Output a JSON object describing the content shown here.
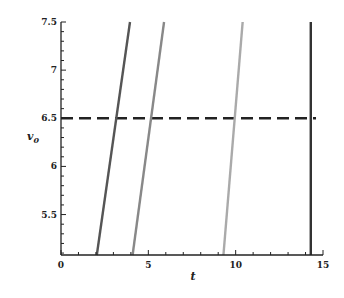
{
  "chart_data": {
    "type": "line",
    "title": "",
    "xlabel": "t",
    "ylabel": "v_0",
    "ylabel_display": "v",
    "ylabel_sub": "0",
    "xlim": [
      0,
      15
    ],
    "ylim": [
      5.08,
      7.5
    ],
    "x_ticks": [
      0,
      5,
      10,
      15
    ],
    "x_tick_labels": [
      "0",
      "5",
      "10",
      "15"
    ],
    "y_ticks": [
      5.5,
      6,
      6.5,
      7,
      7.5
    ],
    "y_tick_labels": [
      "5.5",
      "6",
      "6.5",
      "7",
      "7.5"
    ],
    "grid": false,
    "legend": null,
    "series": [
      {
        "name": "curve-1",
        "color": "#555555",
        "x": [
          2.05,
          3.95
        ],
        "y": [
          5.08,
          7.5
        ]
      },
      {
        "name": "curve-2",
        "color": "#888888",
        "x": [
          4.1,
          5.9
        ],
        "y": [
          5.08,
          7.5
        ]
      },
      {
        "name": "curve-3",
        "color": "#aaaaaa",
        "x": [
          9.3,
          10.4
        ],
        "y": [
          5.08,
          7.5
        ]
      },
      {
        "name": "curve-4",
        "color": "#333333",
        "x": [
          14.3,
          14.3
        ],
        "y": [
          5.08,
          7.5
        ]
      }
    ],
    "reference_lines": [
      {
        "name": "threshold",
        "orientation": "horizontal",
        "y": 6.5,
        "x_range": [
          0,
          14.6
        ],
        "style": "dashed",
        "color": "#222222"
      }
    ]
  }
}
